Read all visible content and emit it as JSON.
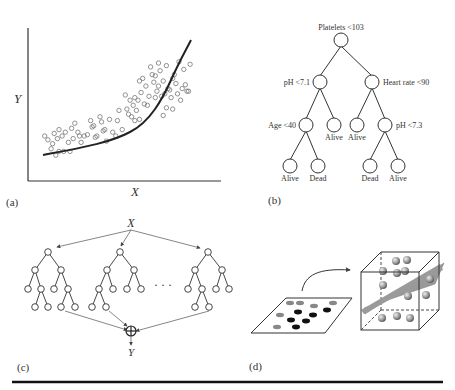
{
  "panels": {
    "a": {
      "label": "(a)",
      "xlabel": "X",
      "ylabel": "Y",
      "description": "Scatter plot with nonlinear (exponential-like) regression curve"
    },
    "b": {
      "label": "(b)",
      "root": "Platelets <103",
      "left": "pH <7.1",
      "right": "Heart rate <90",
      "left_left": "Age <40",
      "left_right_leaf": "Alive",
      "right_left_leaf": "Alive",
      "right_right": "pH <7.3",
      "leaves": [
        "Alive",
        "Dead",
        "Dead",
        "Alive"
      ]
    },
    "c": {
      "label": "(c)",
      "input": "X",
      "output": "Y",
      "ellipsis": "· · ·",
      "combine_symbol": "⊕"
    },
    "d": {
      "label": "(d)",
      "description": "2D points mapped to 3D feature space separated by a hyperplane"
    }
  },
  "chart_data": {
    "type": "scatter",
    "title": "",
    "xlabel": "X",
    "ylabel": "Y",
    "grid": false,
    "note": "Unlabeled axes; points in pixel-relative units (0-100)",
    "points_approx": [
      [
        3,
        25
      ],
      [
        5,
        22
      ],
      [
        7,
        15
      ],
      [
        8,
        19
      ],
      [
        9,
        27
      ],
      [
        10,
        10
      ],
      [
        11,
        23
      ],
      [
        12,
        30
      ],
      [
        12,
        13
      ],
      [
        14,
        25
      ],
      [
        15,
        13
      ],
      [
        16,
        28
      ],
      [
        18,
        20
      ],
      [
        19,
        13
      ],
      [
        20,
        31
      ],
      [
        21,
        23
      ],
      [
        22,
        35
      ],
      [
        24,
        28
      ],
      [
        25,
        25
      ],
      [
        26,
        20
      ],
      [
        28,
        25
      ],
      [
        30,
        26
      ],
      [
        32,
        37
      ],
      [
        33,
        32
      ],
      [
        34,
        33
      ],
      [
        35,
        24
      ],
      [
        36,
        25
      ],
      [
        38,
        40
      ],
      [
        39,
        36
      ],
      [
        40,
        29
      ],
      [
        41,
        30
      ],
      [
        42,
        21
      ],
      [
        44,
        38
      ],
      [
        46,
        28
      ],
      [
        48,
        25
      ],
      [
        49,
        37
      ],
      [
        50,
        45
      ],
      [
        52,
        30
      ],
      [
        54,
        57
      ],
      [
        55,
        46
      ],
      [
        56,
        42
      ],
      [
        57,
        53
      ],
      [
        58,
        40
      ],
      [
        59,
        49
      ],
      [
        60,
        55
      ],
      [
        60,
        37
      ],
      [
        61,
        45
      ],
      [
        62,
        53
      ],
      [
        63,
        38
      ],
      [
        63,
        68
      ],
      [
        64,
        59
      ],
      [
        65,
        70
      ],
      [
        66,
        50
      ],
      [
        67,
        64
      ],
      [
        68,
        49
      ],
      [
        69,
        56
      ],
      [
        70,
        79
      ],
      [
        71,
        73
      ],
      [
        72,
        67
      ],
      [
        73,
        72
      ],
      [
        73,
        55
      ],
      [
        74,
        60
      ],
      [
        75,
        82
      ],
      [
        75,
        64
      ],
      [
        76,
        76
      ],
      [
        77,
        56
      ],
      [
        78,
        68
      ],
      [
        78,
        41
      ],
      [
        79,
        58
      ],
      [
        80,
        80
      ],
      [
        80,
        47
      ],
      [
        81,
        62
      ],
      [
        82,
        61
      ],
      [
        83,
        55
      ],
      [
        84,
        70
      ],
      [
        84,
        46
      ],
      [
        85,
        73
      ],
      [
        86,
        66
      ],
      [
        87,
        58
      ],
      [
        88,
        83
      ],
      [
        89,
        53
      ],
      [
        90,
        62
      ],
      [
        91,
        77
      ],
      [
        92,
        65
      ],
      [
        93,
        60
      ],
      [
        94,
        60
      ],
      [
        95,
        81
      ]
    ],
    "fit_curve": "exponential-like increasing"
  }
}
